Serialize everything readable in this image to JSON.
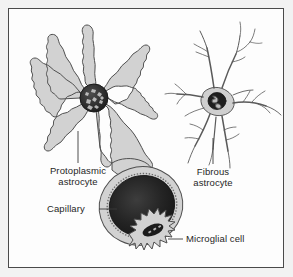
{
  "figure": {
    "kind": "anatomical-diagram",
    "background_color": "#fdfdfd",
    "frame_color": "#4a4a4a",
    "cell_fill_color": "#d2d2d2",
    "outline_color": "#4f4f4f",
    "nucleus_color": "#1a1a1a",
    "label_color": "#262626"
  },
  "labels": {
    "protoplasmic_astrocyte": "Protoplasmic\nastrocyte",
    "fibrous_astrocyte": "Fibrous\nastrocyte",
    "capillary": "Capillary",
    "microglial_cell": "Microglial cell"
  },
  "structures": [
    {
      "name": "protoplasmic-astrocyte",
      "label": "Protoplasmic astrocyte",
      "description": "Star-shaped glial cell with numerous thick, frilly, highly branched processes radiating from a central soma; one process forms an end-foot on the capillary",
      "nucleus": "round, dark, speckled chromatin",
      "leader": "vertical line from soma down to label"
    },
    {
      "name": "fibrous-astrocyte",
      "label": "Fibrous astrocyte",
      "description": "Glial cell with a small soma and long, thin, smooth, sparsely branched fiber-like processes",
      "nucleus": "oval, dark, irregular chromatin",
      "leader": "vertical line from soma down to label"
    },
    {
      "name": "capillary",
      "label": "Capillary",
      "description": "Large oval blood vessel with dark lumen surrounded by a pale stippled endothelial rim, contacted by astrocyte end-feet",
      "leader": "horizontal line from label to vessel wall"
    },
    {
      "name": "microglial-cell",
      "label": "Microglial cell",
      "description": "Small spiky phagocytic glial cell with short stubby processes and an elongated dark nucleus, lying against the capillary",
      "leader": "horizontal line from cell to label"
    }
  ]
}
